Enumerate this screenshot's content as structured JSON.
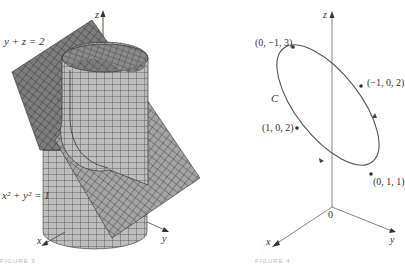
{
  "figures": [
    {
      "id": "left",
      "description": "Plane y + z = 2 intersecting cylinder x^2 + y^2 = 1",
      "labels": {
        "plane_equation": "y + z = 2",
        "cylinder_equation": "x² + y² = 1",
        "axis_z": "z",
        "axis_x": "x",
        "axis_y": "y"
      },
      "caption": "FIGURE 3",
      "colors": {
        "plane_fill": "#7a7a7a",
        "plane_front_fill": "#9a9a9a",
        "cylinder_fill": "#b8b8b8",
        "grid_line": "#2a2a2a"
      }
    },
    {
      "id": "right",
      "description": "Ellipse curve C in 3D with labeled points",
      "labels": {
        "curve_name": "C",
        "axis_z": "z",
        "axis_x": "x",
        "axis_y": "y",
        "origin": "0"
      },
      "points": [
        {
          "label": "(0, −1, 3)"
        },
        {
          "label": "(−1, 0, 2)"
        },
        {
          "label": "(1, 0, 2)"
        },
        {
          "label": "(0, 1, 1)"
        }
      ],
      "caption": "FIGURE 4",
      "colors": {
        "curve": "#555555",
        "axis": "#777777"
      }
    }
  ]
}
